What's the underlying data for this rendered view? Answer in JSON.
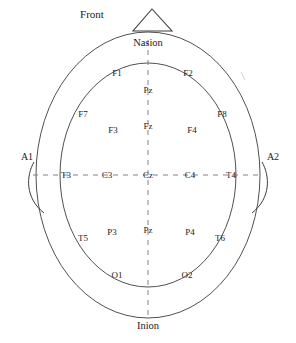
{
  "figure": {
    "kind": "eeg-10-20-electrode-placement-diagram",
    "orientation_label": "Front",
    "anatomy": {
      "nasion": "Nasion",
      "inion": "Inion"
    },
    "ear_references": {
      "left": "A1",
      "right": "A2"
    }
  },
  "electrodes": {
    "frontal_inner_upper": {
      "left": "F1",
      "right": "F2"
    },
    "frontal_lateral": {
      "left": "F7",
      "right": "F8"
    },
    "frontal_mid": {
      "left": "F3",
      "right": "F4"
    },
    "midline_frontal_upper": "Pz",
    "midline_frontal_lower": "Fz",
    "central_row": {
      "temporal_left": "T3",
      "central_left": "C3",
      "vertex": "Cz",
      "central_right": "C4",
      "temporal_right": "T4"
    },
    "parietal_row": {
      "temporal_left": "T5",
      "parietal_left": "P3",
      "midline": "Pz",
      "parietal_right": "P4",
      "temporal_right": "T6"
    },
    "occipital": {
      "left": "O1",
      "right": "O2"
    }
  },
  "positions": {
    "front": {
      "x": 92,
      "y": 14
    },
    "nasion": {
      "x": 148,
      "y": 43
    },
    "inion": {
      "x": 148,
      "y": 326
    },
    "a1": {
      "x": 27,
      "y": 157
    },
    "a2": {
      "x": 273,
      "y": 157
    },
    "f1": {
      "x": 117,
      "y": 73
    },
    "f2": {
      "x": 188,
      "y": 73
    },
    "f7": {
      "x": 83,
      "y": 114
    },
    "f8": {
      "x": 222,
      "y": 114
    },
    "f3": {
      "x": 113,
      "y": 130
    },
    "f4": {
      "x": 192,
      "y": 130
    },
    "midline_upper": {
      "x": 148,
      "y": 90
    },
    "midline_lower": {
      "x": 148,
      "y": 126
    },
    "t3": {
      "x": 66,
      "y": 175
    },
    "c3": {
      "x": 107,
      "y": 175
    },
    "cz": {
      "x": 148,
      "y": 175
    },
    "c4": {
      "x": 190,
      "y": 175
    },
    "t4": {
      "x": 231,
      "y": 175
    },
    "t5": {
      "x": 83,
      "y": 238
    },
    "p3": {
      "x": 112,
      "y": 232
    },
    "pz": {
      "x": 148,
      "y": 230
    },
    "p4": {
      "x": 190,
      "y": 232
    },
    "t6": {
      "x": 220,
      "y": 238
    },
    "o1": {
      "x": 117,
      "y": 275
    },
    "o2": {
      "x": 187,
      "y": 275
    }
  },
  "geometry": {
    "outer_ellipse": {
      "cx": 148,
      "cy": 175,
      "rx": 112,
      "ry": 143
    },
    "inner_ellipse": {
      "cx": 148,
      "cy": 175,
      "rx": 88,
      "ry": 112
    },
    "nose_triangle": {
      "apex_x": 152,
      "apex_y": 9,
      "left_x": 133,
      "right_x": 172,
      "base_y": 31
    },
    "left_ear": {
      "top_x": 34,
      "top_y": 162,
      "bottom_x": 44,
      "bottom_y": 213
    },
    "right_ear": {
      "top_x": 262,
      "top_y": 162,
      "bottom_x": 252,
      "bottom_y": 213
    },
    "vertical_axis": {
      "x": 148,
      "y1": 40,
      "y2": 318
    },
    "horizontal_axis": {
      "y": 175,
      "x1": 33,
      "x2": 263
    }
  },
  "style": {
    "line_color": "#3c3c3c",
    "dash_color": "#8a7f86",
    "text_color": "#1a1a1a",
    "background": "#ffffff"
  }
}
